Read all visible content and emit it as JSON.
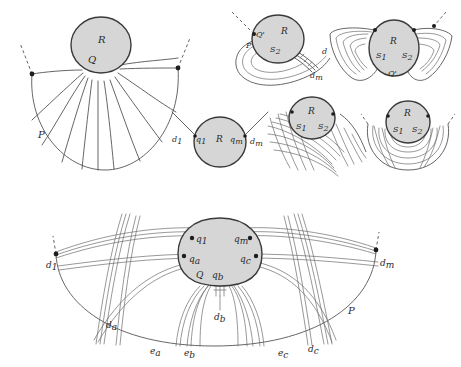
{
  "figure": {
    "background_color": "#ffffff",
    "blob_fill_color": "#d6d6d6",
    "blob_stroke_color": "#3a3a3a",
    "curve_color": "#6b6b6b",
    "label_color": "#2a2a2a"
  },
  "panels": {
    "top_left": {
      "name": "fan-of-arcs-panel",
      "labels": {
        "region": "R",
        "vertex": "Q",
        "outer_boundary": "P"
      }
    },
    "top_middle": {
      "name": "spiral-arc-panel",
      "labels": {
        "region": "R",
        "vertex_prime": "Q'",
        "segment": "S",
        "segment_sub": "2",
        "boundary": "P",
        "edge": "d",
        "edge_m": "d",
        "edge_m_sub": "m"
      }
    },
    "top_right": {
      "name": "bowtie-panel",
      "labels": {
        "region": "R",
        "segment_left": "S",
        "segment_left_sub": "1",
        "segment_right": "S",
        "segment_right_sub": "2",
        "vertex_prime": "Q'"
      }
    },
    "middle_left": {
      "name": "two-edge-circle-panel",
      "labels": {
        "edge_1": "d",
        "edge_1_sub": "1",
        "vertex_q1": "q",
        "vertex_q1_sub": "1",
        "region": "R",
        "vertex_qm": "q",
        "vertex_qm_sub": "m",
        "edge_m": "d",
        "edge_m_sub": "m"
      }
    },
    "middle_center": {
      "name": "grid-mesh-panel",
      "labels": {
        "region": "R",
        "segment_left": "S",
        "segment_left_sub": "1",
        "segment_right": "S",
        "segment_right_sub": "2"
      }
    },
    "middle_right": {
      "name": "nested-arcs-panel",
      "labels": {
        "region": "R",
        "segment_left": "S",
        "segment_left_sub": "1",
        "segment_right": "S",
        "segment_right_sub": "2"
      }
    },
    "bottom": {
      "name": "full-construction-panel",
      "labels": {
        "edge_d1": "d",
        "edge_d1_sub": "1",
        "edge_dm": "d",
        "edge_dm_sub": "m",
        "vertex_q1": "q",
        "vertex_q1_sub": "1",
        "vertex_qm": "q",
        "vertex_qm_sub": "m",
        "vertex_qa": "q",
        "vertex_qa_sub": "a",
        "vertex_qc": "q",
        "vertex_qc_sub": "c",
        "vertex_Q": "Q",
        "vertex_qb": "q",
        "vertex_qb_sub": "b",
        "edge_da": "d",
        "edge_da_sub": "a",
        "edge_db": "d",
        "edge_db_sub": "b",
        "edge_dc": "d",
        "edge_dc_sub": "c",
        "edge_ea": "e",
        "edge_ea_sub": "a",
        "edge_eb": "e",
        "edge_eb_sub": "b",
        "edge_ec": "e",
        "edge_ec_sub": "c",
        "outer_boundary": "P"
      }
    }
  }
}
